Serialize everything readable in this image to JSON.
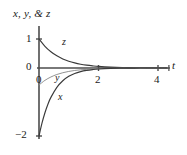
{
  "figure": {
    "yaxis_label": "x, y, & z",
    "xaxis_label": "t",
    "curve_labels": {
      "x": "x",
      "y": "y",
      "z": "z"
    },
    "ticks": {
      "y_one": "1",
      "y_zero": "0",
      "y_minus_two": "−2",
      "x_zero": "0",
      "x_two": "2",
      "x_four": "4"
    },
    "colors": {
      "axis": "#4d4d4d",
      "curve_x": "#3a3a3a",
      "curve_y": "#8c8c8c",
      "curve_z": "#3a3a3a",
      "text": "#1a1a1a",
      "background": "#ffffff"
    }
  },
  "chart_data": {
    "type": "line",
    "title": "",
    "xlabel": "t",
    "ylabel": "x, y, & z",
    "xlim": [
      -0.15,
      4.4
    ],
    "ylim": [
      -2.25,
      1.45
    ],
    "grid": false,
    "legend": "inline-curve-labels",
    "xticks": [
      0,
      2,
      4
    ],
    "xticklabels": [
      "0",
      "2",
      "4"
    ],
    "yticks": [
      -2,
      0,
      1
    ],
    "yticklabels": [
      "−2",
      "0",
      "1"
    ],
    "annotations": [
      {
        "text": "z",
        "x": 0.85,
        "y": 0.62
      },
      {
        "text": "y",
        "x": 0.62,
        "y": -0.2
      },
      {
        "text": "x",
        "x": 0.75,
        "y": -0.65
      }
    ],
    "series": [
      {
        "name": "z",
        "expression": "z(t) = e^(-1.45 t)",
        "x": [
          0.0,
          0.2,
          0.4,
          0.6,
          0.8,
          1.0,
          1.2,
          1.4,
          1.6,
          1.8,
          2.0,
          2.4,
          2.8,
          3.2,
          3.6,
          4.0,
          4.3
        ],
        "y": [
          1.0,
          0.748,
          0.56,
          0.419,
          0.313,
          0.235,
          0.176,
          0.131,
          0.098,
          0.074,
          0.055,
          0.031,
          0.017,
          0.01,
          0.005,
          0.003,
          0.002
        ]
      },
      {
        "name": "y",
        "expression": "y(t) = -0.5 e^(-1.6 t)",
        "x": [
          0.0,
          0.2,
          0.4,
          0.6,
          0.8,
          1.0,
          1.2,
          1.4,
          1.6,
          1.8,
          2.0,
          2.4,
          2.8,
          3.2,
          3.6,
          4.0,
          4.3
        ],
        "y": [
          -0.5,
          -0.363,
          -0.264,
          -0.191,
          -0.139,
          -0.101,
          -0.073,
          -0.053,
          -0.039,
          -0.028,
          -0.02,
          -0.011,
          -0.006,
          -0.003,
          -0.002,
          -0.001,
          0.0
        ]
      },
      {
        "name": "x",
        "expression": "x(t) = -2 e^(-2.1 t)",
        "x": [
          0.0,
          0.1,
          0.2,
          0.3,
          0.4,
          0.6,
          0.8,
          1.0,
          1.2,
          1.4,
          1.6,
          1.8,
          2.0,
          2.4,
          2.8,
          3.2,
          3.6,
          4.0,
          4.3
        ],
        "y": [
          -2.0,
          -1.621,
          -1.315,
          -1.066,
          -0.864,
          -0.568,
          -0.374,
          -0.245,
          -0.161,
          -0.106,
          -0.07,
          -0.046,
          -0.03,
          -0.013,
          -0.006,
          -0.002,
          -0.001,
          0.0,
          0.0
        ]
      }
    ]
  }
}
